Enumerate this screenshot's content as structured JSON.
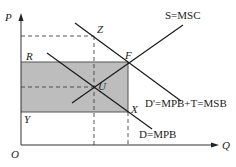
{
  "diagram": {
    "type": "economics supply-demand externality diagram",
    "axes": {
      "y_label": "P",
      "x_label": "Q",
      "origin_label": "O"
    },
    "curves": {
      "supply": "S=MSC",
      "social_demand": "D'=MPB+T=MSB",
      "private_demand": "D=MPB"
    },
    "points": {
      "Z": "Z",
      "F": "F",
      "U": "U",
      "R": "R",
      "X": "X",
      "Y": "Y"
    },
    "colors": {
      "shaded_region": "#bdbdbd",
      "lines": "#1a1a1a",
      "dashed": "#444444"
    }
  }
}
